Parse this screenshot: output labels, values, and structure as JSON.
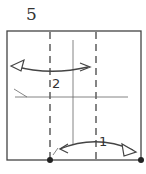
{
  "step_number": "5",
  "labels": {
    "fold1": "1",
    "fold2": "2"
  },
  "colors": {
    "line": "#444444",
    "background": "#ffffff"
  },
  "icons": [
    "fold-arrow-icon",
    "valley-fold-line",
    "reference-dot-icon"
  ]
}
